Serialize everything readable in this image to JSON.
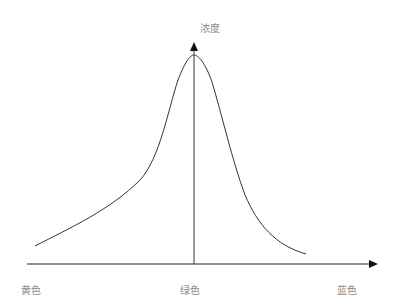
{
  "diagram": {
    "y_axis_label": "浓度",
    "x_axis_labels": {
      "left": "黄色",
      "center": "绿色",
      "right": "蓝色"
    },
    "colors": {
      "axis": "#222222",
      "curve": "#333333",
      "label": "#8a8a8a"
    }
  }
}
